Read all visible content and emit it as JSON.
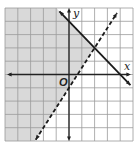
{
  "chart_data": {
    "type": "inequality-graph",
    "title": "",
    "xlabel": "x",
    "ylabel": "y",
    "origin_label": "O",
    "xlim": [
      -5,
      5
    ],
    "ylim": [
      -5,
      5
    ],
    "grid": true,
    "grid_step": 1,
    "lines": [
      {
        "name": "solid-boundary",
        "equation": "y = -x + 4",
        "slope": -1,
        "intercept": 4,
        "style": "solid",
        "arrows": "both"
      },
      {
        "name": "dashed-boundary",
        "equation": "y = 1.5x - 1",
        "slope": 1.5,
        "intercept": -1,
        "style": "dashed",
        "arrows": "both"
      }
    ],
    "intersection": [
      2,
      2
    ],
    "shaded_region": "y <= -x + 4 and y > 1.5x - 1",
    "colors": {
      "shade": "#d9d9d9",
      "grid": "#9a9a9a",
      "axis": "#222222",
      "line": "#1a1a1a",
      "background": "#ffffff"
    }
  }
}
